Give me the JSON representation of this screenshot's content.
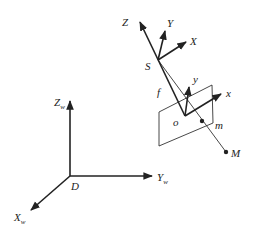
{
  "diagram": {
    "title": "",
    "world_frame": {
      "origin_label": "D",
      "axes": [
        {
          "name": "Z",
          "sub": "w"
        },
        {
          "name": "Y",
          "sub": "w"
        },
        {
          "name": "X",
          "sub": "w"
        }
      ]
    },
    "camera_frame": {
      "origin_label": "S",
      "axes": [
        {
          "name": "Z"
        },
        {
          "name": "Y"
        },
        {
          "name": "X"
        }
      ]
    },
    "image_frame": {
      "origin_label": "o",
      "axes": [
        {
          "name": "y"
        },
        {
          "name": "x"
        }
      ]
    },
    "focal_length_label": "f",
    "image_point_label": "m",
    "object_point_label": "M",
    "colors": {
      "line": "#222222",
      "background": "#ffffff"
    }
  }
}
